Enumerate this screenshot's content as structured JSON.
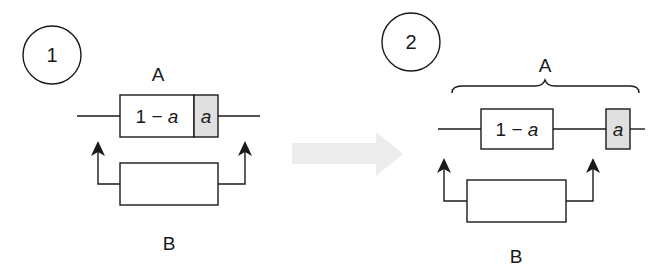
{
  "colors": {
    "stroke": "#1a1a1a",
    "shaded_fill": "#e0e0e0",
    "box_fill": "#ffffff",
    "transition_arrow": "#ececec"
  },
  "diagram_1": {
    "step_number": "1",
    "top_label": "A",
    "bottom_label": "B",
    "box_a_main": {
      "prefix": "1 − ",
      "variable": "a"
    },
    "box_a_shaded": {
      "variable": "a"
    }
  },
  "transition": {
    "icon": "right-arrow-icon"
  },
  "diagram_2": {
    "step_number": "2",
    "top_label": "A",
    "bottom_label": "B",
    "box_a_main": {
      "prefix": "1 − ",
      "variable": "a"
    },
    "box_a_shaded": {
      "variable": "a"
    },
    "grouping": "curly-brace-icon"
  }
}
